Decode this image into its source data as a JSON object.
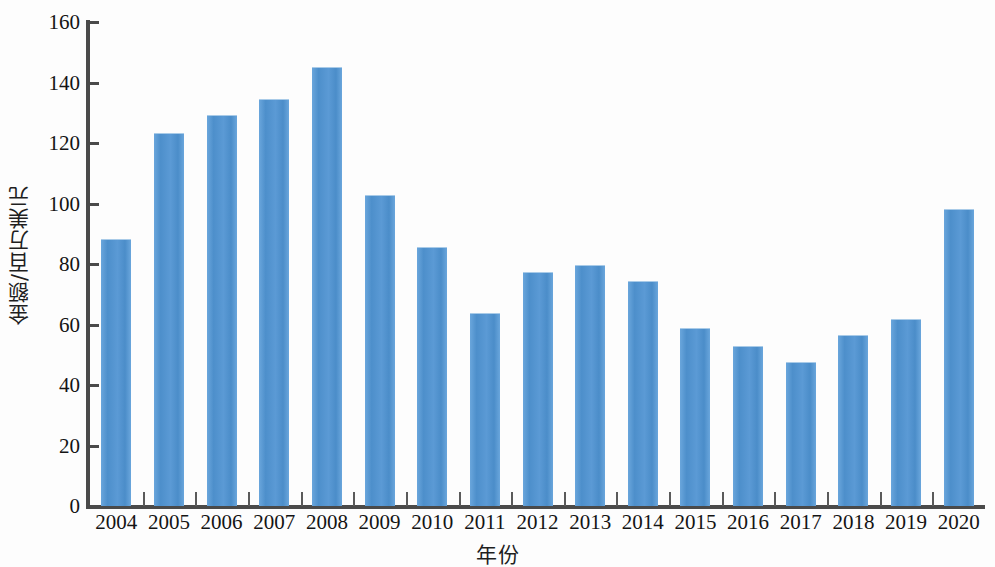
{
  "chart_data": {
    "type": "bar",
    "title": "",
    "xlabel": "年份",
    "ylabel": "金额/百万美元",
    "categories": [
      "2004",
      "2005",
      "2006",
      "2007",
      "2008",
      "2009",
      "2010",
      "2011",
      "2012",
      "2013",
      "2014",
      "2015",
      "2016",
      "2017",
      "2018",
      "2019",
      "2020"
    ],
    "values": [
      88.4,
      123.4,
      129.2,
      134.6,
      145.2,
      102.8,
      85.5,
      63.8,
      77.4,
      79.8,
      74.3,
      58.8,
      53.0,
      47.5,
      56.4,
      61.8,
      98.2
    ],
    "ylim": [
      0,
      160
    ],
    "ytick_labels": [
      "160",
      "140",
      "120",
      "100",
      "80",
      "60",
      "40",
      "20",
      "0"
    ],
    "ytick_values": [
      160,
      140,
      120,
      100,
      80,
      60,
      40,
      20,
      0
    ],
    "grid": false,
    "legend": null,
    "series_color": "#5b9ad5",
    "axis_color": "#4a4a4a"
  }
}
